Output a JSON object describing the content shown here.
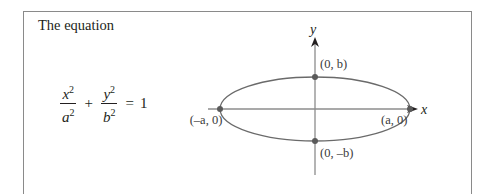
{
  "text": {
    "title": "The equation",
    "equation": {
      "term1": {
        "num": "x",
        "den": "a",
        "exp": "2"
      },
      "plus": "+",
      "term2": {
        "num": "y",
        "den": "b",
        "exp": "2"
      },
      "equals": "=",
      "rhs": "1"
    }
  },
  "figure": {
    "axis_x_label": "x",
    "axis_y_label": "y",
    "points": [
      {
        "label": "(0, b)"
      },
      {
        "label": "(0, –b)"
      },
      {
        "label": "(–a, 0)"
      },
      {
        "label": "(a, 0)"
      }
    ],
    "colors": {
      "axis": "#8c8c8c",
      "ellipse": "#6a6a6a",
      "point": "#5a5a5a",
      "arrow": "#231f20"
    }
  }
}
